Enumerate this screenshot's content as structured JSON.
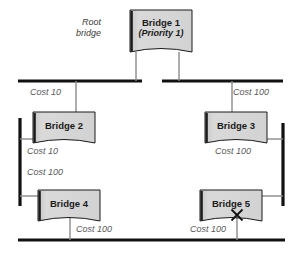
{
  "diagram": {
    "colors": {
      "segment": "#111111",
      "box_fill": "#d4d4d4",
      "box_edge": "#1a1a1a",
      "link": "#8a8a8a",
      "cost_text": "#5a5a5a",
      "note_text": "#3c3c3c",
      "background": "#ffffff"
    },
    "bridges": [
      {
        "id": "bridge-1",
        "label": "Bridge 1",
        "sub": "(Priority 1)",
        "x": 130,
        "y": 10,
        "w": 62,
        "h": 42
      },
      {
        "id": "bridge-2",
        "label": "Bridge 2",
        "sub": "",
        "x": 33,
        "y": 112,
        "w": 62,
        "h": 31
      },
      {
        "id": "bridge-3",
        "label": "Bridge 3",
        "sub": "",
        "x": 205,
        "y": 112,
        "w": 62,
        "h": 31
      },
      {
        "id": "bridge-4",
        "label": "Bridge 4",
        "sub": "",
        "x": 38,
        "y": 190,
        "w": 62,
        "h": 31
      },
      {
        "id": "bridge-5",
        "label": "Bridge 5",
        "sub": "",
        "x": 200,
        "y": 190,
        "w": 62,
        "h": 31
      }
    ],
    "notes": [
      {
        "id": "root-bridge-note",
        "line1": "Root",
        "line2": "bridge",
        "x": 76,
        "y": 17
      }
    ],
    "costs": [
      {
        "id": "cost-b1-b2",
        "text": "Cost 10",
        "x": 30,
        "y": 87
      },
      {
        "id": "cost-b1-b3",
        "text": "Cost 100",
        "x": 233,
        "y": 87
      },
      {
        "id": "cost-b2-left",
        "text": "Cost 10",
        "x": 27,
        "y": 146
      },
      {
        "id": "cost-b3-right",
        "text": "Cost 100",
        "x": 215,
        "y": 146
      },
      {
        "id": "cost-b4-left",
        "text": "Cost 100",
        "x": 27,
        "y": 167
      },
      {
        "id": "cost-b4-bottom",
        "text": "Cost 100",
        "x": 76,
        "y": 224
      },
      {
        "id": "cost-b5-bottom",
        "text": "Cost 100",
        "x": 190,
        "y": 224
      }
    ],
    "blocked_ports": [
      {
        "id": "blocked-port-bridge-5",
        "x": 237,
        "y": 215,
        "size": 11
      }
    ],
    "segments": [
      {
        "id": "segment-top-left",
        "orientation": "horizontal",
        "x1": 18,
        "y1": 81,
        "x2": 142,
        "y2": 81
      },
      {
        "id": "segment-top-right",
        "orientation": "horizontal",
        "x1": 162,
        "y1": 81,
        "x2": 283,
        "y2": 81
      },
      {
        "id": "segment-left",
        "orientation": "vertical",
        "x1": 20,
        "y1": 118,
        "x2": 20,
        "y2": 206
      },
      {
        "id": "segment-right",
        "orientation": "vertical",
        "x1": 283,
        "y1": 123,
        "x2": 283,
        "y2": 206
      },
      {
        "id": "segment-bottom",
        "orientation": "horizontal",
        "x1": 18,
        "y1": 240,
        "x2": 285,
        "y2": 240
      }
    ],
    "links": [
      {
        "id": "link-b1-to-top-left",
        "points": "136,52 136,81"
      },
      {
        "id": "link-b1-to-top-right",
        "points": "179,52 179,81"
      },
      {
        "id": "link-top-left-to-b2",
        "points": "76,81 76,112"
      },
      {
        "id": "link-top-right-to-b3",
        "points": "232,81 232,112"
      },
      {
        "id": "link-b2-to-left-segment",
        "points": "38,139 20,139"
      },
      {
        "id": "link-b3-to-right-segment",
        "points": "264,139 283,139"
      },
      {
        "id": "link-left-segment-to-b4",
        "points": "20,196 43,196"
      },
      {
        "id": "link-right-segment-to-b5",
        "points": "283,196 259,196"
      },
      {
        "id": "link-b4-to-bottom",
        "points": "70,214 70,240"
      },
      {
        "id": "link-b5-to-bottom",
        "points": "237,208 237,240"
      }
    ]
  }
}
